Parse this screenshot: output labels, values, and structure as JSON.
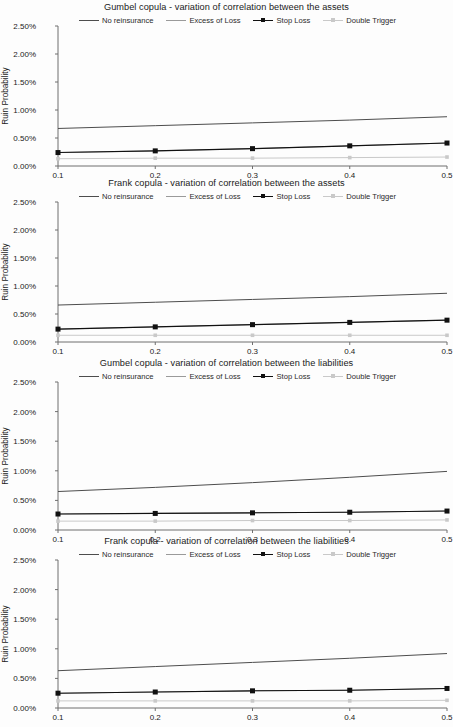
{
  "figure": {
    "series_names": [
      "No reinsurance",
      "Excess of Loss",
      "Stop Loss",
      "Double Trigger"
    ],
    "colors": {
      "no_reinsurance": "#4d4d4d",
      "excess_of_loss": "#9a9a9a",
      "stop_loss": "#111111",
      "double_trigger": "#c9c9c9"
    },
    "y_axis_label": "Ruin Probability",
    "y_ticks": [
      "0.00%",
      "0.50%",
      "1.00%",
      "1.50%",
      "2.00%",
      "2.50%"
    ],
    "x_ticks": [
      "0.1",
      "0.2",
      "0.3",
      "0.4",
      "0.5"
    ]
  },
  "charts": [
    {
      "title": "Gumbel copula - variation of correlation between the assets",
      "legend": [
        "No reinsurance",
        "Excess of Loss",
        "Stop Loss",
        "Double Trigger"
      ],
      "chart_data": {
        "type": "line",
        "title": "Gumbel copula - variation of correlation between the assets",
        "xlabel": "",
        "ylabel": "Ruin Probability",
        "x": [
          0.1,
          0.2,
          0.3,
          0.4,
          0.5
        ],
        "xlim": [
          0.1,
          0.5
        ],
        "ylim": [
          0.0,
          2.5
        ],
        "y_tick_values": [
          0.0,
          0.5,
          1.0,
          1.5,
          2.0,
          2.5
        ],
        "y_unit": "%",
        "grid": false,
        "legend_position": "top",
        "series": [
          {
            "name": "No reinsurance",
            "values": [
              0.67,
              0.72,
              0.77,
              0.82,
              0.88
            ],
            "marker": "none"
          },
          {
            "name": "Excess of Loss",
            "values": [
              0.24,
              0.27,
              0.31,
              0.36,
              0.41
            ],
            "marker": "none"
          },
          {
            "name": "Stop Loss",
            "values": [
              0.24,
              0.27,
              0.31,
              0.36,
              0.41
            ],
            "marker": "square"
          },
          {
            "name": "Double Trigger",
            "values": [
              0.13,
              0.14,
              0.14,
              0.15,
              0.16
            ],
            "marker": "square"
          }
        ]
      }
    },
    {
      "title": "Frank copula - variation of correlation between the assets",
      "legend": [
        "No reinsurance",
        "Excess of Loss",
        "Stop Loss",
        "Double Trigger"
      ],
      "chart_data": {
        "type": "line",
        "title": "Frank copula - variation of correlation between the assets",
        "xlabel": "",
        "ylabel": "Ruin Probability",
        "x": [
          0.1,
          0.2,
          0.3,
          0.4,
          0.5
        ],
        "xlim": [
          0.1,
          0.5
        ],
        "ylim": [
          0.0,
          2.5
        ],
        "y_tick_values": [
          0.0,
          0.5,
          1.0,
          1.5,
          2.0,
          2.5
        ],
        "y_unit": "%",
        "grid": false,
        "legend_position": "top",
        "series": [
          {
            "name": "No reinsurance",
            "values": [
              0.66,
              0.71,
              0.76,
              0.81,
              0.87
            ],
            "marker": "none"
          },
          {
            "name": "Excess of Loss",
            "values": [
              0.23,
              0.27,
              0.31,
              0.35,
              0.39
            ],
            "marker": "none"
          },
          {
            "name": "Stop Loss",
            "values": [
              0.23,
              0.27,
              0.31,
              0.35,
              0.39
            ],
            "marker": "square"
          },
          {
            "name": "Double Trigger",
            "values": [
              0.12,
              0.12,
              0.12,
              0.12,
              0.12
            ],
            "marker": "square"
          }
        ]
      }
    },
    {
      "title": "Gumbel copula - variation of correlation between the liabilities",
      "legend": [
        "No reinsurance",
        "Excess of Loss",
        "Stop Loss",
        "Double Trigger"
      ],
      "chart_data": {
        "type": "line",
        "title": "Gumbel copula - variation of correlation between the liabilities",
        "xlabel": "",
        "ylabel": "Ruin Probability",
        "x": [
          0.1,
          0.2,
          0.3,
          0.4,
          0.5
        ],
        "xlim": [
          0.1,
          0.5
        ],
        "ylim": [
          0.0,
          2.5
        ],
        "y_tick_values": [
          0.0,
          0.5,
          1.0,
          1.5,
          2.0,
          2.5
        ],
        "y_unit": "%",
        "grid": false,
        "legend_position": "top",
        "series": [
          {
            "name": "No reinsurance",
            "values": [
              0.65,
              0.72,
              0.8,
              0.89,
              0.99
            ],
            "marker": "none"
          },
          {
            "name": "Excess of Loss",
            "values": [
              0.27,
              0.28,
              0.29,
              0.3,
              0.32
            ],
            "marker": "none"
          },
          {
            "name": "Stop Loss",
            "values": [
              0.27,
              0.28,
              0.29,
              0.3,
              0.32
            ],
            "marker": "square"
          },
          {
            "name": "Double Trigger",
            "values": [
              0.15,
              0.15,
              0.16,
              0.16,
              0.17
            ],
            "marker": "square"
          }
        ]
      }
    },
    {
      "title": "Frank copula - variation of correlation between the liabilities",
      "legend": [
        "No reinsurance",
        "Excess of Loss",
        "Stop Loss",
        "Double Trigger"
      ],
      "chart_data": {
        "type": "line",
        "title": "Frank copula - variation of correlation between the liabilities",
        "xlabel": "",
        "ylabel": "Ruin Probability",
        "x": [
          0.1,
          0.2,
          0.3,
          0.4,
          0.5
        ],
        "xlim": [
          0.1,
          0.5
        ],
        "ylim": [
          0.0,
          2.5
        ],
        "y_tick_values": [
          0.0,
          0.5,
          1.0,
          1.5,
          2.0,
          2.5
        ],
        "y_unit": "%",
        "grid": false,
        "legend_position": "top",
        "series": [
          {
            "name": "No reinsurance",
            "values": [
              0.63,
              0.7,
              0.77,
              0.84,
              0.92
            ],
            "marker": "none"
          },
          {
            "name": "Excess of Loss",
            "values": [
              0.25,
              0.27,
              0.29,
              0.3,
              0.33
            ],
            "marker": "none"
          },
          {
            "name": "Stop Loss",
            "values": [
              0.25,
              0.27,
              0.29,
              0.3,
              0.33
            ],
            "marker": "square"
          },
          {
            "name": "Double Trigger",
            "values": [
              0.12,
              0.12,
              0.12,
              0.12,
              0.13
            ],
            "marker": "square"
          }
        ]
      }
    }
  ]
}
